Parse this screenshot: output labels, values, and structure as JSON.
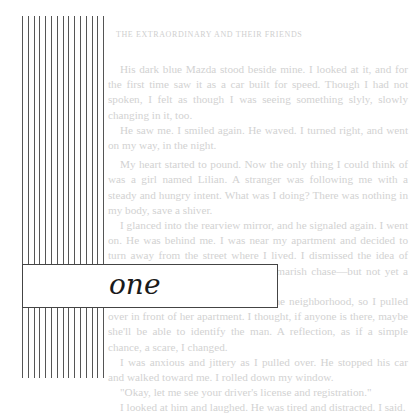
{
  "page": {
    "running_head": "the extraordinary and their friends",
    "chapter_label": "one",
    "paragraphs": [
      "His dark blue Mazda stood beside mine. I looked at it, and for the first time saw it as a car built for speed. Though I had not spoken, I felt as though I was seeing something slyly, slowly changing in it, too.",
      "He saw me. I smiled again. He waved. I turned right, and went on my way, in the night.",
      "My heart started to pound. Now the only thing I could think of was a girl named Lilian. A stranger was following me with a steady and hungry intent. What was I doing? There was nothing in my body, save a shiver.",
      "I glanced into the rearview mirror, and he signaled again. I went on. He was behind me. I was near my apartment and decided to turn away from the street where I lived. I dismissed the idea of driving to the police. It was a nightmarish chase—but not yet a pursuit.",
      "My friend Donna Anne lived in the neighborhood, so I pulled over in front of her apartment. I thought, if anyone is there, maybe she'll be able to identify the man. A reflection, as if a simple chance, a scare, I changed.",
      "I was anxious and jittery as I pulled over. He stopped his car and walked toward me. I rolled down my window.",
      "\"Okay, let me see your driver's license and registration.\"",
      "I looked at him and laughed. He was tired and distracted. I said."
    ]
  }
}
